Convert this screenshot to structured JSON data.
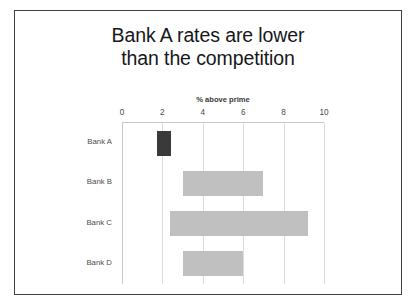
{
  "slide": {
    "title_line_1": "Bank A rates are lower",
    "title_line_2": "than the competition"
  },
  "chart_data": {
    "type": "bar",
    "orientation": "horizontal",
    "title": "Bank A rates are lower than the competition",
    "subtitle": "",
    "xlabel": "% above prime",
    "ylabel": "",
    "axis_title_position": "top",
    "xlim": [
      0,
      10
    ],
    "xticks": [
      "0",
      "2",
      "4",
      "6",
      "8",
      "10"
    ],
    "xtick_values": [
      0,
      2,
      4,
      6,
      8,
      10
    ],
    "grid": true,
    "grid_axis": "x",
    "legend": "none",
    "categories": [
      "Bank A",
      "Bank B",
      "Bank C",
      "Bank D"
    ],
    "value_kind": "range",
    "bars": [
      {
        "category": "Bank A",
        "start": 1.75,
        "end": 2.45,
        "highlight": true,
        "color": "#3a3a3a"
      },
      {
        "category": "Bank B",
        "start": 3.0,
        "end": 7.0,
        "highlight": false,
        "color": "#c0c0c0"
      },
      {
        "category": "Bank C",
        "start": 2.4,
        "end": 9.2,
        "highlight": false,
        "color": "#c0c0c0"
      },
      {
        "category": "Bank D",
        "start": 3.0,
        "end": 6.0,
        "highlight": false,
        "color": "#c0c0c0"
      }
    ]
  },
  "colors": {
    "highlight_bar": "#3a3a3a",
    "default_bar": "#c0c0c0",
    "gridline": "#dcdcdc",
    "axis_line": "#c9c9c9",
    "slide_border": "#3f3f46",
    "title_text": "#17171a",
    "label_text": "#4d4d4d",
    "background": "#ffffff"
  }
}
